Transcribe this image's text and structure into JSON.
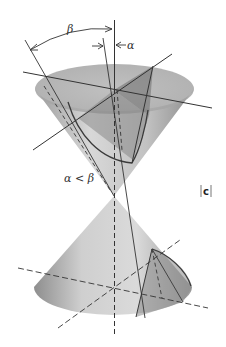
{
  "figure": {
    "labels": {
      "beta": "β",
      "alpha": "α",
      "condition": "α < β",
      "panel": "c"
    },
    "colors": {
      "cone_light": "#e4e4e4",
      "cone_mid": "#bdbdbd",
      "cone_dark": "#8a8a8a",
      "plane": "#7d7d7d",
      "line": "#333333"
    }
  }
}
